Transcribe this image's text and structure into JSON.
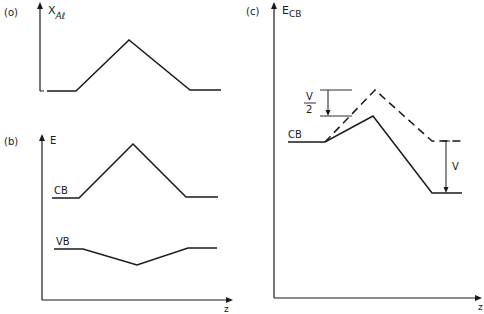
{
  "figure": {
    "panel_a": {
      "tag": "(o)",
      "ylabel_main": "X",
      "ylabel_sub": "Aℓ",
      "profile": [
        [
          47,
          91
        ],
        [
          76,
          91
        ],
        [
          129,
          40
        ],
        [
          190,
          90
        ],
        [
          221,
          90
        ]
      ]
    },
    "panel_b": {
      "tag": "(b)",
      "ylabel": "E",
      "xlabel": "z",
      "cb_label": "CB",
      "vb_label": "VB",
      "cb_profile": [
        [
          52,
          198
        ],
        [
          79,
          198
        ],
        [
          133,
          144
        ],
        [
          186,
          197
        ],
        [
          218,
          197
        ]
      ],
      "vb_profile": [
        [
          54,
          249
        ],
        [
          83,
          249
        ],
        [
          137,
          265
        ],
        [
          188,
          248
        ],
        [
          217,
          248
        ]
      ]
    },
    "panel_c": {
      "tag": "(c)",
      "ylabel_main": "E",
      "ylabel_sub": "CB",
      "xlabel": "z",
      "cb_label": "CB",
      "half_v_num": "V",
      "half_v_den": "2",
      "v_label": "V",
      "solid_profile": [
        [
          288,
          142
        ],
        [
          325,
          142
        ],
        [
          373,
          116
        ],
        [
          432,
          193
        ],
        [
          462,
          193
        ]
      ],
      "dashed_profile": [
        [
          325,
          142
        ],
        [
          375,
          90
        ],
        [
          432,
          141
        ],
        [
          465,
          141
        ]
      ]
    }
  }
}
